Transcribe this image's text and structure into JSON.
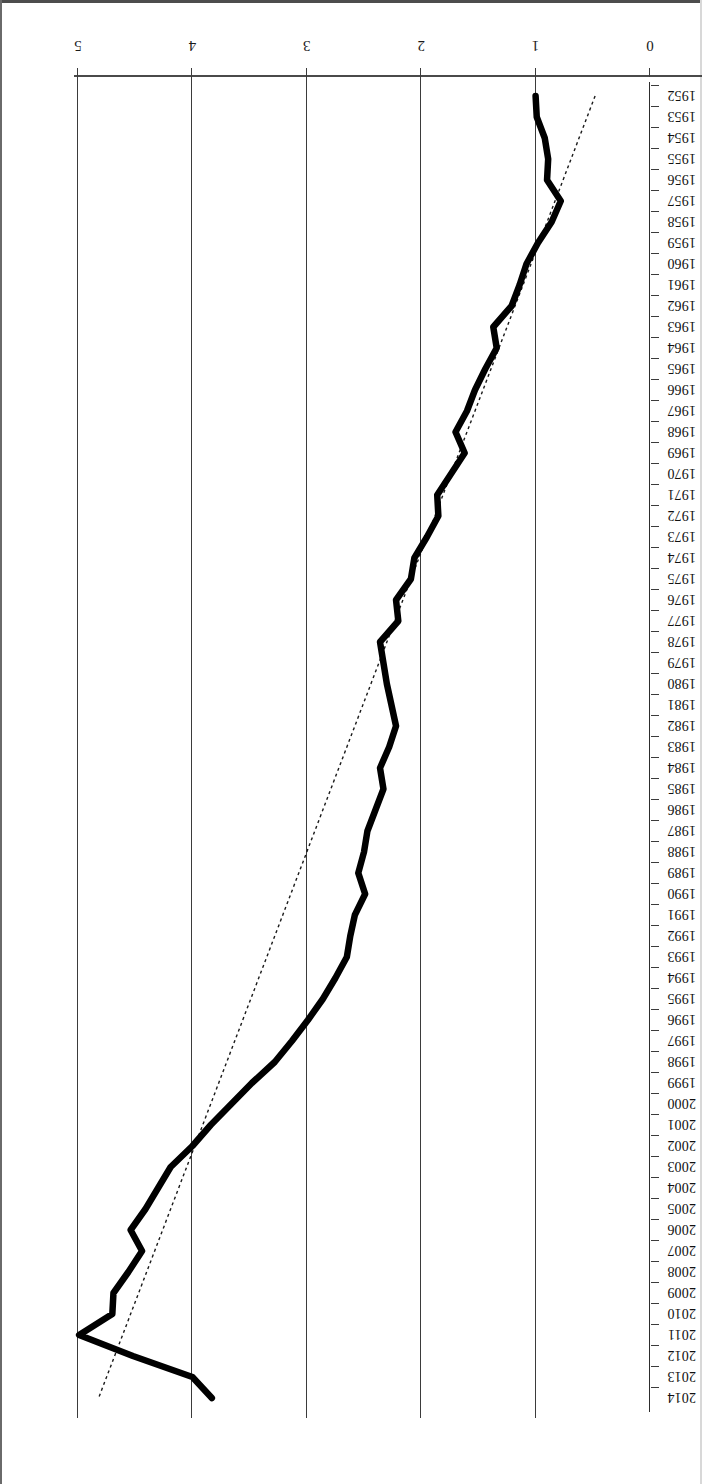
{
  "figure": {
    "orientation": "rotated-180",
    "background": "#ffffff",
    "line_color": "#000000",
    "trend_color": "#1a1a1a",
    "grid_color": "#3b3b3b"
  },
  "chart_data": {
    "type": "line",
    "title": "",
    "subtitle": "",
    "xlabel": "",
    "ylabel": "",
    "orientation": "rotated-180",
    "grid": true,
    "legend": "none",
    "value_axis": {
      "ticks": [
        "0",
        "1",
        "2",
        "3",
        "4",
        "5"
      ],
      "range": [
        0,
        5.2
      ],
      "gridlines_at": [
        1,
        2,
        3,
        4,
        5
      ]
    },
    "category_axis": {
      "tick_labels": [
        "1952",
        "1953",
        "1954",
        "1955",
        "1956",
        "1957",
        "1958",
        "1959",
        "1960",
        "1961",
        "1962",
        "1963",
        "1964",
        "1965",
        "1966",
        "1967",
        "1968",
        "1969",
        "1970",
        "1971",
        "1972",
        "1973",
        "1974",
        "1975",
        "1976",
        "1977",
        "1978",
        "1979",
        "1980",
        "1981",
        "1982",
        "1983",
        "1984",
        "1985",
        "1986",
        "1987",
        "1988",
        "1989",
        "1990",
        "1991",
        "1992",
        "1993",
        "1994",
        "1995",
        "1996",
        "1997",
        "1998",
        "1999",
        "2000",
        "2001",
        "2002",
        "2003",
        "2004",
        "2005",
        "2006",
        "2007",
        "2008",
        "2009",
        "2010",
        "2011",
        "2012",
        "2013",
        "2014"
      ]
    },
    "categories": [
      1952,
      1953,
      1954,
      1955,
      1956,
      1957,
      1958,
      1959,
      1960,
      1961,
      1962,
      1963,
      1964,
      1965,
      1966,
      1967,
      1968,
      1969,
      1970,
      1971,
      1972,
      1973,
      1974,
      1975,
      1976,
      1977,
      1978,
      1979,
      1980,
      1981,
      1982,
      1983,
      1984,
      1985,
      1986,
      1987,
      1988,
      1989,
      1990,
      1991,
      1992,
      1993,
      1994,
      1995,
      1996,
      1997,
      1998,
      1999,
      2000,
      2001,
      2002,
      2003,
      2004,
      2005,
      2006,
      2007,
      2008,
      2009,
      2010,
      2011,
      2012,
      2013,
      2014
    ],
    "series": [
      {
        "name": "observed",
        "style": "solid-thick",
        "values": [
          1.0,
          0.99,
          0.92,
          0.89,
          0.9,
          0.78,
          0.86,
          0.98,
          1.08,
          1.14,
          1.21,
          1.37,
          1.34,
          1.44,
          1.53,
          1.6,
          1.7,
          1.62,
          1.74,
          1.86,
          1.85,
          1.95,
          2.06,
          2.09,
          2.22,
          2.2,
          2.36,
          2.33,
          2.3,
          2.26,
          2.22,
          2.28,
          2.36,
          2.33,
          2.4,
          2.47,
          2.5,
          2.55,
          2.49,
          2.58,
          2.62,
          2.65,
          2.75,
          2.86,
          2.99,
          3.13,
          3.28,
          3.48,
          3.66,
          3.84,
          4.0,
          4.19,
          4.3,
          4.41,
          4.54,
          4.44,
          4.56,
          4.69,
          4.7,
          4.99,
          4.52,
          4.0,
          3.83
        ]
      },
      {
        "name": "linear-trend",
        "style": "dotted-thin",
        "endpoints": [
          {
            "x": 1952,
            "y": 0.48
          },
          {
            "x": 2014,
            "y": 4.82
          }
        ]
      }
    ]
  }
}
